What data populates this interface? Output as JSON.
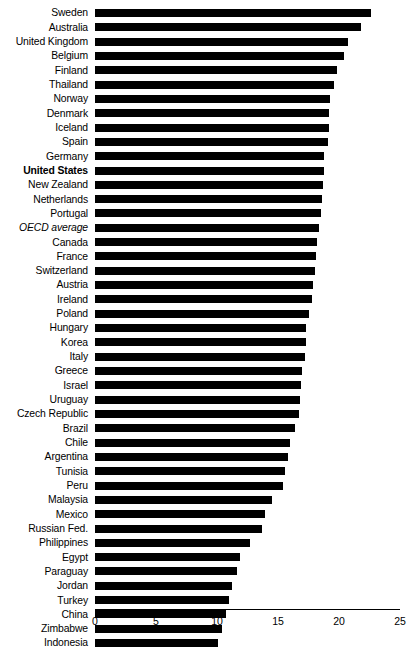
{
  "chart_data": {
    "type": "bar",
    "orientation": "horizontal",
    "title": "",
    "subtitle": "",
    "xlabel": "",
    "ylabel": "",
    "xlim": [
      0,
      25
    ],
    "xticks": [
      "0",
      "5",
      "10",
      "15",
      "20",
      "25"
    ],
    "grid": false,
    "legend": null,
    "bar_color": "#000000",
    "background_color": "#ffffff",
    "categories": [
      "Sweden",
      "Australia",
      "United Kingdom",
      "Belgium",
      "Finland",
      "Thailand",
      "Norway",
      "Denmark",
      "Iceland",
      "Spain",
      "Germany",
      "United States",
      "New Zealand",
      "Netherlands",
      "Portugal",
      "OECD average",
      "Canada",
      "France",
      "Switzerland",
      "Austria",
      "Ireland",
      "Poland",
      "Hungary",
      "Korea",
      "Italy",
      "Greece",
      "Israel",
      "Uruguay",
      "Czech Republic",
      "Brazil",
      "Chile",
      "Argentina",
      "Tunisia",
      "Peru",
      "Malaysia",
      "Mexico",
      "Russian Fed.",
      "Philippines",
      "Egypt",
      "Paraguay",
      "Jordan",
      "Turkey",
      "China",
      "Zimbabwe",
      "Indonesia"
    ],
    "values": [
      22.6,
      21.8,
      20.7,
      20.4,
      19.8,
      19.6,
      19.3,
      19.2,
      19.2,
      19.1,
      18.8,
      18.8,
      18.7,
      18.6,
      18.5,
      18.4,
      18.2,
      18.1,
      18.0,
      17.9,
      17.8,
      17.5,
      17.3,
      17.3,
      17.2,
      17.0,
      16.9,
      16.8,
      16.7,
      16.4,
      16.0,
      15.8,
      15.6,
      15.4,
      14.5,
      13.9,
      13.7,
      12.7,
      11.9,
      11.6,
      11.2,
      11.0,
      10.7,
      10.4,
      10.1
    ],
    "emphasis": {
      "bold": [
        "United States"
      ],
      "italic": [
        "OECD average"
      ]
    }
  }
}
